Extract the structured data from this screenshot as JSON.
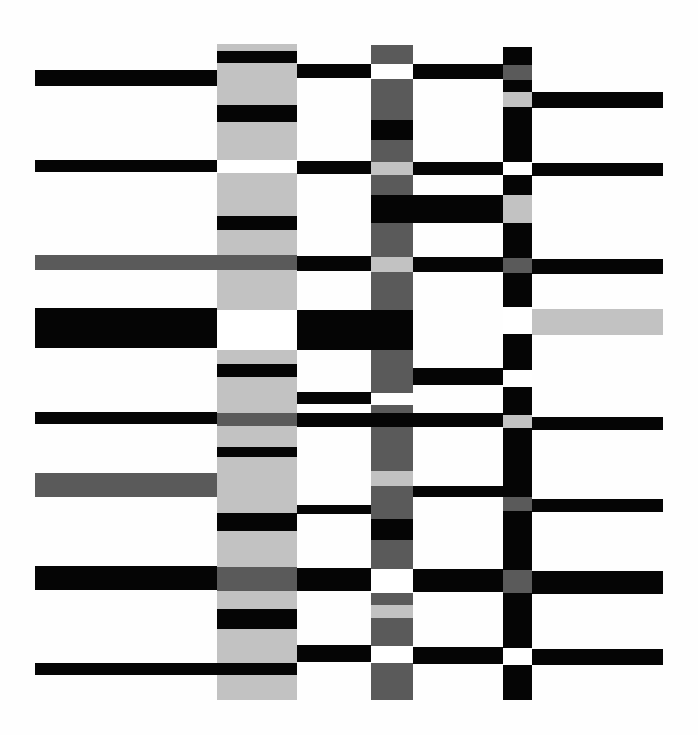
{
  "artwork": {
    "description": "Abstract composition of horizontal bars crossing four vertical columns",
    "palette": {
      "black": "#050505",
      "dark": "#5a5a5a",
      "light": "#c2c2c2",
      "white": "#ffffff"
    },
    "rects": [
      {
        "x": 217,
        "y": 44,
        "w": 80,
        "h": 656,
        "c": "light"
      },
      {
        "x": 371,
        "y": 45,
        "w": 42,
        "h": 655,
        "c": "dark"
      },
      {
        "x": 503,
        "y": 47,
        "w": 29,
        "h": 653,
        "c": "black"
      },
      {
        "x": 217,
        "y": 51,
        "w": 80,
        "h": 12,
        "c": "black"
      },
      {
        "x": 35,
        "y": 70,
        "w": 182,
        "h": 16,
        "c": "black"
      },
      {
        "x": 297,
        "y": 64,
        "w": 74,
        "h": 14,
        "c": "black"
      },
      {
        "x": 371,
        "y": 64,
        "w": 42,
        "h": 15,
        "c": "white"
      },
      {
        "x": 413,
        "y": 64,
        "w": 90,
        "h": 15,
        "c": "black"
      },
      {
        "x": 503,
        "y": 65,
        "w": 29,
        "h": 15,
        "c": "dark"
      },
      {
        "x": 503,
        "y": 92,
        "w": 29,
        "h": 15,
        "c": "light"
      },
      {
        "x": 532,
        "y": 92,
        "w": 131,
        "h": 16,
        "c": "black"
      },
      {
        "x": 217,
        "y": 105,
        "w": 80,
        "h": 17,
        "c": "black"
      },
      {
        "x": 371,
        "y": 120,
        "w": 42,
        "h": 20,
        "c": "black"
      },
      {
        "x": 217,
        "y": 160,
        "w": 80,
        "h": 13,
        "c": "white"
      },
      {
        "x": 35,
        "y": 160,
        "w": 182,
        "h": 12,
        "c": "black"
      },
      {
        "x": 297,
        "y": 161,
        "w": 74,
        "h": 13,
        "c": "black"
      },
      {
        "x": 371,
        "y": 162,
        "w": 42,
        "h": 13,
        "c": "light"
      },
      {
        "x": 413,
        "y": 162,
        "w": 90,
        "h": 13,
        "c": "black"
      },
      {
        "x": 503,
        "y": 162,
        "w": 29,
        "h": 13,
        "c": "white"
      },
      {
        "x": 532,
        "y": 163,
        "w": 131,
        "h": 13,
        "c": "black"
      },
      {
        "x": 503,
        "y": 195,
        "w": 29,
        "h": 28,
        "c": "light"
      },
      {
        "x": 371,
        "y": 195,
        "w": 132,
        "h": 28,
        "c": "black"
      },
      {
        "x": 217,
        "y": 216,
        "w": 80,
        "h": 14,
        "c": "black"
      },
      {
        "x": 35,
        "y": 255,
        "w": 262,
        "h": 15,
        "c": "dark"
      },
      {
        "x": 297,
        "y": 256,
        "w": 74,
        "h": 15,
        "c": "black"
      },
      {
        "x": 371,
        "y": 257,
        "w": 42,
        "h": 15,
        "c": "light"
      },
      {
        "x": 413,
        "y": 257,
        "w": 90,
        "h": 15,
        "c": "black"
      },
      {
        "x": 503,
        "y": 258,
        "w": 29,
        "h": 15,
        "c": "dark"
      },
      {
        "x": 532,
        "y": 259,
        "w": 131,
        "h": 15,
        "c": "black"
      },
      {
        "x": 35,
        "y": 308,
        "w": 182,
        "h": 40,
        "c": "black"
      },
      {
        "x": 217,
        "y": 310,
        "w": 80,
        "h": 40,
        "c": "white"
      },
      {
        "x": 297,
        "y": 310,
        "w": 116,
        "h": 40,
        "c": "black"
      },
      {
        "x": 503,
        "y": 307,
        "w": 29,
        "h": 27,
        "c": "white"
      },
      {
        "x": 532,
        "y": 309,
        "w": 131,
        "h": 26,
        "c": "light"
      },
      {
        "x": 217,
        "y": 364,
        "w": 80,
        "h": 13,
        "c": "black"
      },
      {
        "x": 413,
        "y": 368,
        "w": 90,
        "h": 17,
        "c": "black"
      },
      {
        "x": 503,
        "y": 370,
        "w": 29,
        "h": 17,
        "c": "white"
      },
      {
        "x": 297,
        "y": 392,
        "w": 74,
        "h": 12,
        "c": "black"
      },
      {
        "x": 371,
        "y": 393,
        "w": 42,
        "h": 12,
        "c": "white"
      },
      {
        "x": 371,
        "y": 405,
        "w": 42,
        "h": 8,
        "c": "dark"
      },
      {
        "x": 35,
        "y": 412,
        "w": 182,
        "h": 12,
        "c": "black"
      },
      {
        "x": 217,
        "y": 413,
        "w": 80,
        "h": 13,
        "c": "dark"
      },
      {
        "x": 297,
        "y": 413,
        "w": 206,
        "h": 14,
        "c": "black"
      },
      {
        "x": 503,
        "y": 415,
        "w": 29,
        "h": 13,
        "c": "light"
      },
      {
        "x": 532,
        "y": 417,
        "w": 131,
        "h": 13,
        "c": "black"
      },
      {
        "x": 217,
        "y": 447,
        "w": 80,
        "h": 10,
        "c": "black"
      },
      {
        "x": 35,
        "y": 473,
        "w": 182,
        "h": 24,
        "c": "dark"
      },
      {
        "x": 371,
        "y": 471,
        "w": 42,
        "h": 15,
        "c": "light"
      },
      {
        "x": 413,
        "y": 486,
        "w": 90,
        "h": 11,
        "c": "black"
      },
      {
        "x": 503,
        "y": 497,
        "w": 29,
        "h": 14,
        "c": "dark"
      },
      {
        "x": 532,
        "y": 499,
        "w": 131,
        "h": 13,
        "c": "black"
      },
      {
        "x": 297,
        "y": 505,
        "w": 74,
        "h": 9,
        "c": "black"
      },
      {
        "x": 217,
        "y": 513,
        "w": 80,
        "h": 18,
        "c": "black"
      },
      {
        "x": 371,
        "y": 519,
        "w": 42,
        "h": 21,
        "c": "black"
      },
      {
        "x": 35,
        "y": 566,
        "w": 182,
        "h": 24,
        "c": "black"
      },
      {
        "x": 217,
        "y": 567,
        "w": 80,
        "h": 24,
        "c": "dark"
      },
      {
        "x": 297,
        "y": 568,
        "w": 74,
        "h": 23,
        "c": "black"
      },
      {
        "x": 371,
        "y": 569,
        "w": 42,
        "h": 24,
        "c": "white"
      },
      {
        "x": 413,
        "y": 569,
        "w": 90,
        "h": 23,
        "c": "black"
      },
      {
        "x": 503,
        "y": 570,
        "w": 29,
        "h": 23,
        "c": "dark"
      },
      {
        "x": 532,
        "y": 571,
        "w": 131,
        "h": 23,
        "c": "black"
      },
      {
        "x": 371,
        "y": 605,
        "w": 42,
        "h": 13,
        "c": "light"
      },
      {
        "x": 217,
        "y": 609,
        "w": 80,
        "h": 20,
        "c": "black"
      },
      {
        "x": 297,
        "y": 645,
        "w": 74,
        "h": 17,
        "c": "black"
      },
      {
        "x": 371,
        "y": 646,
        "w": 42,
        "h": 17,
        "c": "white"
      },
      {
        "x": 413,
        "y": 647,
        "w": 90,
        "h": 17,
        "c": "black"
      },
      {
        "x": 503,
        "y": 648,
        "w": 29,
        "h": 17,
        "c": "white"
      },
      {
        "x": 532,
        "y": 649,
        "w": 131,
        "h": 16,
        "c": "black"
      },
      {
        "x": 35,
        "y": 663,
        "w": 262,
        "h": 12,
        "c": "black"
      }
    ]
  }
}
